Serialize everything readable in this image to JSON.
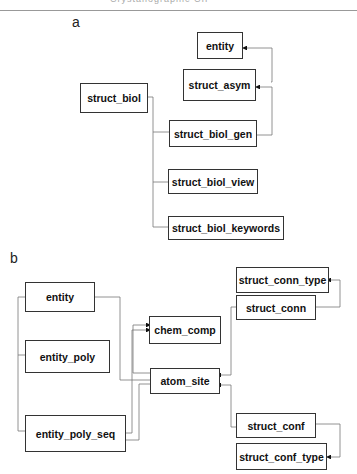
{
  "header": {
    "text": "Crystallographic CIF"
  },
  "panel_a": {
    "label": "a",
    "boxes": {
      "entity": "entity",
      "struct_asym": "struct_asym",
      "struct_biol": "struct_biol",
      "struct_biol_gen": "struct_biol_gen",
      "struct_biol_view": "struct_biol_view",
      "struct_biol_keywords": "struct_biol_keywords"
    }
  },
  "panel_b": {
    "label": "b",
    "boxes": {
      "entity": "entity",
      "entity_poly": "entity_poly",
      "entity_poly_seq": "entity_poly_seq",
      "chem_comp": "chem_comp",
      "atom_site": "atom_site",
      "struct_conn_type": "struct_conn_type",
      "struct_conn": "struct_conn",
      "struct_conf": "struct_conf",
      "struct_conf_type": "struct_conf_type"
    }
  }
}
